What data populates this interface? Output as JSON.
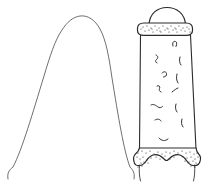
{
  "illustration": {
    "title": "Two-view line drawing of an artifact",
    "background_color": "#ffffff",
    "ink_color": "#2b2b2b",
    "thin_ink_color": "#4a4a4a",
    "canvas": {
      "width": 211,
      "height": 190
    }
  },
  "figures": [
    {
      "id": "left-profile",
      "name": "Profile outline view",
      "description": "Thin single-line inverted-U arch with splayed legs and small hooked tips",
      "stroke_color": "#4a4a4a",
      "stroke_width": 0.8,
      "path": "M 8 179 C 7 173 9 170 13 167 C 22 150 33 112 44 76 C 50 56 55 40 62 30 C 67 22 73 17 80 16 C 88 15 95 20 100 29 C 106 40 109 57 112 78 C 118 115 124 152 130 167 C 133 170 135 173 134 179",
      "tips": [
        {
          "name": "left-tip",
          "x": 8,
          "y": 179
        },
        {
          "name": "right-tip",
          "x": 134,
          "y": 179
        }
      ]
    },
    {
      "id": "right-detail",
      "name": "Detailed frontal view",
      "description": "Domed cap over stippled collar band, tapering shaft with squiggle texture marks, stippled bifurcated base",
      "stroke_color": "#2b2b2b",
      "parts": [
        {
          "name": "dome-cap",
          "shape": "semicircular dome",
          "x_range": [
            148,
            186
          ],
          "y_range": [
            8,
            26
          ]
        },
        {
          "name": "collar-band",
          "shape": "rounded stippled band",
          "x_range": [
            136,
            193
          ],
          "y_range": [
            23,
            35
          ]
        },
        {
          "name": "shaft",
          "shape": "slightly tapering rectangle",
          "x_range": [
            139,
            196
          ],
          "y_range": [
            35,
            148
          ]
        },
        {
          "name": "base",
          "shape": "stippled arch with two feet",
          "x_range": [
            134,
            201
          ],
          "y_range": [
            146,
            184
          ]
        }
      ],
      "shaft_paths": {
        "left_edge": "M 140.5 35 L 139.5 148",
        "right_edge": "M 190.5 35 L 196 148"
      },
      "cap_path": "M 149 26 C 149 13 158 7.5 167 7.5 C 176 7.5 185.5 13 185.5 26",
      "collar_path": "M 137.5 28.5 C 137.5 24.5 140 23 144 23 L 186 23 C 190 23 192.5 24.5 192.5 28.5 L 192.5 30.5 C 192.5 34 190 35.3 186 35.3 L 144 35.3 C 140 35.3 137.5 34 137.5 30.5 Z",
      "base_path": "M 139.5 148 L 196 148 C 196.5 152 197.5 153 199 154.5 C 200.5 156 200.8 159 200 161.5 C 199 164.5 196 166 193 165.5 C 190 165 188 163 186.5 160.5 C 185 158 183 156 180 155 C 176 153.8 172.5 155.5 170 158 C 168.5 159.6 167.5 160.5 166.5 160.5 C 165.5 160.5 164.5 159.6 163 158 C 160.5 155.5 157 153.8 153 155 C 150 156 148 158 146.5 160.5 C 145 163 143 165 140 165.5 C 137 166 134.5 164.5 134 161.5 C 133.2 159 133.8 156 135 154.5 C 136.4 153 138.5 152 139.5 148 Z",
      "base_feet": [
        {
          "name": "left-foot-tail",
          "path": "M 139.5 165 C 139 170 139.2 176 140.5 181"
        },
        {
          "name": "right-foot-tail",
          "path": "M 194.5 165 C 195 170 194.8 176 193.5 181"
        }
      ],
      "squiggles": [
        {
          "name": "squiggle-1",
          "path": "M 173 46 C 172 42.5 173.5 41 175.5 41.5 C 177 42 177 44 176 46.5"
        },
        {
          "name": "squiggle-2",
          "path": "M 156 55 C 158 55.5 158.5 58 156.5 59.5 C 155 60.6 155.5 62.5 157 63"
        },
        {
          "name": "squiggle-3",
          "path": "M 180 57 C 179 60 179.5 63 181 65"
        },
        {
          "name": "squiggle-4",
          "path": "M 162 73 C 164 71 166 71.5 166.5 73.5 C 167 75.5 165.5 77 163.5 77"
        },
        {
          "name": "squiggle-5",
          "path": "M 177 74 C 176 77.5 176.5 80.5 178 83"
        },
        {
          "name": "squiggle-6",
          "path": "M 157 86 C 159 85 160.5 86.5 159.5 88.5 C 158.8 90 159.5 91.5 161 92"
        },
        {
          "name": "squiggle-7",
          "path": "M 172 92 C 174.5 90 176.5 88.5 178 88"
        },
        {
          "name": "squiggle-8",
          "path": "M 151 105 C 153.5 103.5 156 105.5 158 107 C 159.5 108 161 108 162.5 106.5"
        },
        {
          "name": "squiggle-9",
          "path": "M 176 104 C 175 107 175.5 110 177 112"
        },
        {
          "name": "squiggle-10",
          "path": "M 155 120 C 157.5 118.5 160 119 161 121"
        },
        {
          "name": "squiggle-11",
          "path": "M 182 119 C 181 122 181.5 125 183 127"
        },
        {
          "name": "squiggle-12",
          "path": "M 159 138 C 161.5 141 165 141.5 168 139"
        }
      ],
      "stipple_collar": [
        [
          143,
          27
        ],
        [
          147,
          26
        ],
        [
          151,
          28
        ],
        [
          155,
          26
        ],
        [
          159,
          28
        ],
        [
          163,
          26
        ],
        [
          167,
          28
        ],
        [
          171,
          26
        ],
        [
          175,
          28
        ],
        [
          179,
          26
        ],
        [
          183,
          28
        ],
        [
          187,
          27
        ],
        [
          145,
          31
        ],
        [
          149,
          30
        ],
        [
          153,
          32
        ],
        [
          157,
          30
        ],
        [
          161,
          32
        ],
        [
          165,
          30
        ],
        [
          169,
          32
        ],
        [
          173,
          30
        ],
        [
          177,
          32
        ],
        [
          181,
          30
        ],
        [
          185,
          31
        ],
        [
          189,
          29
        ],
        [
          141,
          29
        ],
        [
          190,
          32
        ],
        [
          152,
          29
        ],
        [
          168,
          29
        ],
        [
          176,
          29
        ],
        [
          160,
          31
        ]
      ],
      "stipple_base": [
        [
          138,
          153
        ],
        [
          142,
          151
        ],
        [
          146,
          153
        ],
        [
          150,
          151
        ],
        [
          154,
          154
        ],
        [
          158,
          152
        ],
        [
          162,
          154
        ],
        [
          166,
          152
        ],
        [
          170,
          153
        ],
        [
          174,
          151
        ],
        [
          178,
          153
        ],
        [
          182,
          151
        ],
        [
          186,
          153
        ],
        [
          190,
          152
        ],
        [
          194,
          154
        ],
        [
          197,
          153
        ],
        [
          137,
          157
        ],
        [
          140,
          159
        ],
        [
          143,
          157
        ],
        [
          147,
          160
        ],
        [
          151,
          158
        ],
        [
          144,
          162
        ],
        [
          148,
          163
        ],
        [
          141,
          163
        ],
        [
          183,
          157
        ],
        [
          187,
          158
        ],
        [
          191,
          157
        ],
        [
          195,
          159
        ],
        [
          198,
          157
        ],
        [
          185,
          161
        ],
        [
          189,
          162
        ],
        [
          193,
          161
        ],
        [
          196,
          163
        ],
        [
          138,
          167
        ],
        [
          142,
          166
        ],
        [
          191,
          166
        ],
        [
          195,
          167
        ],
        [
          156,
          157
        ],
        [
          165,
          156
        ],
        [
          174,
          157
        ],
        [
          160,
          159
        ],
        [
          170,
          159
        ]
      ]
    }
  ]
}
